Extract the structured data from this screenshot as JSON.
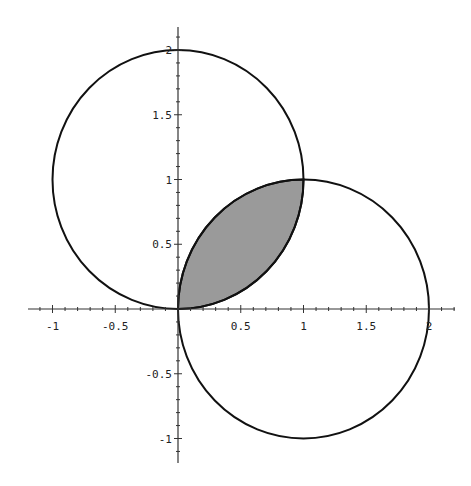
{
  "chart_data": {
    "type": "line",
    "title": "",
    "xlabel": "",
    "ylabel": "",
    "xlim": [
      -1.2,
      2.2
    ],
    "ylim": [
      -1.2,
      2.2
    ],
    "grid": false,
    "legend": null,
    "x_ticks": [
      "-1",
      "-0.5",
      "0.5",
      "1",
      "1.5",
      "2"
    ],
    "y_ticks": [
      "-1",
      "-0.5",
      "0.5",
      "1",
      "1.5",
      "2"
    ],
    "series": [
      {
        "name": "circle-upper",
        "shape": "circle",
        "center": [
          0,
          1
        ],
        "radius": 1,
        "description": "x^2 + (y-1)^2 = 1"
      },
      {
        "name": "circle-right",
        "shape": "circle",
        "center": [
          1,
          0
        ],
        "radius": 1,
        "description": "(x-1)^2 + y^2 = 1"
      }
    ],
    "shaded_region": {
      "description": "Lens-shaped intersection of the two disks",
      "vertices": [
        [
          0,
          0
        ],
        [
          1,
          1
        ]
      ],
      "fill": "#9a9a9a"
    },
    "intersection_points": [
      [
        0,
        0
      ],
      [
        1,
        1
      ]
    ]
  },
  "colors": {
    "curve": "#111111",
    "axis": "#333333",
    "shade": "#9a9a9a",
    "background": "#ffffff"
  }
}
